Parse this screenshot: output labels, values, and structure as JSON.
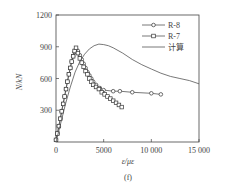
{
  "chart_data": {
    "type": "line",
    "title": "",
    "panel_label": "(f)",
    "xlabel": "ε/με",
    "ylabel": "N/kN",
    "xlim": [
      0,
      15000
    ],
    "ylim": [
      0,
      1200
    ],
    "xticks": [
      0,
      5000,
      10000,
      15000
    ],
    "xtick_labels": [
      "0",
      "5000",
      "10 000",
      "15 000"
    ],
    "yticks": [
      300,
      600,
      900,
      1200
    ],
    "ytick_labels": [
      "300",
      "600",
      "900",
      "1200"
    ],
    "grid": false,
    "legend_position": "upper right",
    "series": [
      {
        "name": "R-8",
        "marker": "circle",
        "x": [
          0,
          150,
          300,
          450,
          600,
          750,
          900,
          1050,
          1200,
          1350,
          1500,
          1650,
          1800,
          1950,
          2100,
          2300,
          2500,
          2700,
          2900,
          3100,
          3300,
          3500,
          3700,
          3900,
          4200,
          4600,
          5000,
          6000,
          6700,
          8000,
          10000,
          11000
        ],
        "y": [
          20,
          80,
          150,
          220,
          290,
          360,
          430,
          500,
          570,
          640,
          700,
          760,
          810,
          850,
          880,
          860,
          820,
          780,
          740,
          700,
          660,
          630,
          600,
          570,
          540,
          510,
          490,
          480,
          480,
          470,
          460,
          450
        ]
      },
      {
        "name": "R-7",
        "marker": "square",
        "x": [
          0,
          150,
          300,
          450,
          600,
          750,
          900,
          1050,
          1200,
          1350,
          1500,
          1650,
          1800,
          1950,
          2100,
          2300,
          2500,
          2700,
          2900,
          3100,
          3300,
          3500,
          3700,
          3900,
          4200,
          4500,
          4800,
          5100,
          5400,
          5700,
          6000,
          6300,
          6600,
          6900
        ],
        "y": [
          20,
          80,
          150,
          220,
          290,
          360,
          430,
          500,
          570,
          640,
          700,
          760,
          810,
          860,
          890,
          840,
          790,
          750,
          710,
          670,
          640,
          600,
          570,
          540,
          520,
          500,
          470,
          450,
          430,
          410,
          390,
          370,
          350,
          330
        ]
      },
      {
        "name": "计算",
        "marker": "none",
        "x": [
          0,
          500,
          1000,
          1500,
          2000,
          2500,
          3000,
          3500,
          4000,
          4500,
          5000,
          5500,
          6000,
          7000,
          8000,
          9000,
          10000,
          11000,
          12000,
          13000,
          14000,
          15000
        ],
        "y": [
          0,
          180,
          360,
          520,
          660,
          760,
          830,
          880,
          910,
          925,
          920,
          910,
          890,
          840,
          780,
          730,
          690,
          650,
          620,
          600,
          580,
          550
        ]
      }
    ]
  }
}
